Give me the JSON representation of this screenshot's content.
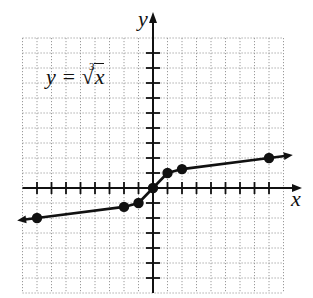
{
  "chart_data": {
    "type": "line",
    "title": "",
    "function_label": "y = ∛x",
    "function_label_parts": {
      "lhs": "y =",
      "index": "3",
      "radical": "√",
      "radicand": "x"
    },
    "xlabel": "x",
    "ylabel": "y",
    "xlim": [
      -9,
      9
    ],
    "ylim": [
      -7,
      10
    ],
    "grid": true,
    "grid_style": "dotted",
    "x_tick_step": 1,
    "y_tick_step": 1,
    "tick_labels_shown": false,
    "arrows_on_curve_ends": true,
    "series": [
      {
        "name": "y = ∛x",
        "x": [
          -8,
          -2,
          -1,
          0,
          1,
          2,
          8
        ],
        "y": [
          -2,
          -1.26,
          -1,
          0,
          1,
          1.26,
          2
        ],
        "marker": "filled-circle",
        "color": "#111111"
      }
    ],
    "legend": null
  },
  "colors": {
    "curve": "#111111",
    "axis": "#111111",
    "grid": "#9a9a9a",
    "background": "#ffffff"
  }
}
